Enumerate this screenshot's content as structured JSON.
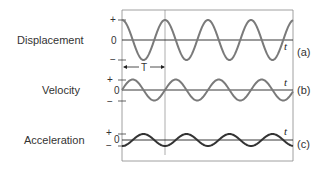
{
  "diagram": {
    "rows": [
      {
        "label": "Displacement",
        "tag": "(a)",
        "plus": "+",
        "zero": "0",
        "minus": "−",
        "axis_var": "t"
      },
      {
        "label": "Velocity",
        "tag": "(b)",
        "plus": "+",
        "zero": "0",
        "minus": "−",
        "axis_var": "t"
      },
      {
        "label": "Acceleration",
        "tag": "(c)",
        "plus": "+",
        "zero": "0",
        "minus": "−",
        "axis_var": "t"
      }
    ],
    "period_label": "T",
    "colors": {
      "displacement": "#7a7a7a",
      "velocity": "#7a7a7a",
      "acceleration": "#333333",
      "axis": "#222222",
      "frame": "#888888"
    }
  }
}
